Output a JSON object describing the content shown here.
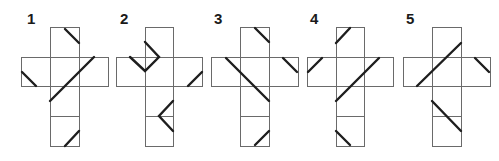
{
  "puzzle": {
    "figures": [
      {
        "label": "1",
        "label_pos": [
          27,
          11
        ],
        "cells": [
          [
            50,
            27,
            29,
            30
          ],
          [
            21,
            57,
            29,
            29
          ],
          [
            50,
            57,
            29,
            29
          ],
          [
            79,
            57,
            29,
            29
          ],
          [
            50,
            86,
            29,
            30
          ],
          [
            50,
            116,
            29,
            30
          ]
        ],
        "marks": [
          [
            [
              65,
              29
            ],
            [
              79,
              43
            ]
          ],
          [
            [
              22,
              72
            ],
            [
              36,
              86
            ]
          ],
          [
            [
              94,
              57
            ],
            [
              50,
              101
            ]
          ],
          [
            [
              65,
              146
            ],
            [
              79,
              131
            ]
          ]
        ]
      },
      {
        "label": "2",
        "label_pos": [
          120,
          11
        ],
        "cells": [
          [
            145,
            27,
            28,
            30
          ],
          [
            116,
            57,
            29,
            29
          ],
          [
            145,
            57,
            28,
            29
          ],
          [
            173,
            57,
            29,
            29
          ],
          [
            145,
            86,
            28,
            30
          ],
          [
            145,
            116,
            28,
            30
          ]
        ],
        "marks": [
          [
            [
              145,
              42
            ],
            [
              159,
              57
            ],
            [
              145,
              71
            ],
            [
              130,
              57
            ]
          ],
          [
            [
              202,
              72
            ],
            [
              188,
              86
            ]
          ],
          [
            [
              173,
              101
            ],
            [
              159,
              116
            ],
            [
              173,
              131
            ]
          ]
        ]
      },
      {
        "label": "3",
        "label_pos": [
          214,
          11
        ],
        "cells": [
          [
            240,
            27,
            29,
            30
          ],
          [
            211,
            57,
            29,
            29
          ],
          [
            240,
            57,
            29,
            29
          ],
          [
            269,
            57,
            29,
            29
          ],
          [
            240,
            86,
            29,
            30
          ],
          [
            240,
            116,
            29,
            30
          ]
        ],
        "marks": [
          [
            [
              255,
              28
            ],
            [
              269,
              42
            ]
          ],
          [
            [
              283,
              58
            ],
            [
              297,
              72
            ]
          ],
          [
            [
              226,
              58
            ],
            [
              269,
              101
            ]
          ],
          [
            [
              255,
              145
            ],
            [
              269,
              131
            ]
          ]
        ]
      },
      {
        "label": "4",
        "label_pos": [
          310,
          11
        ],
        "cells": [
          [
            336,
            27,
            28,
            30
          ],
          [
            307,
            57,
            29,
            29
          ],
          [
            336,
            57,
            28,
            29
          ],
          [
            364,
            57,
            29,
            29
          ],
          [
            336,
            86,
            28,
            30
          ],
          [
            336,
            116,
            28,
            30
          ]
        ],
        "marks": [
          [
            [
              350,
              28
            ],
            [
              336,
              43
            ]
          ],
          [
            [
              322,
              58
            ],
            [
              308,
              72
            ]
          ],
          [
            [
              379,
              58
            ],
            [
              336,
              101
            ]
          ],
          [
            [
              336,
              131
            ],
            [
              350,
              145
            ]
          ]
        ]
      },
      {
        "label": "5",
        "label_pos": [
          406,
          11
        ],
        "cells": [
          [
            432,
            27,
            29,
            30
          ],
          [
            403,
            57,
            29,
            29
          ],
          [
            432,
            57,
            29,
            29
          ],
          [
            461,
            57,
            29,
            29
          ],
          [
            432,
            86,
            29,
            30
          ],
          [
            432,
            116,
            29,
            30
          ]
        ],
        "marks": [
          [
            [
              461,
              43
            ],
            [
              417,
              86
            ]
          ],
          [
            [
              475,
              58
            ],
            [
              489,
              72
            ]
          ],
          [
            [
              432,
              101
            ],
            [
              461,
              131
            ]
          ]
        ]
      }
    ]
  }
}
